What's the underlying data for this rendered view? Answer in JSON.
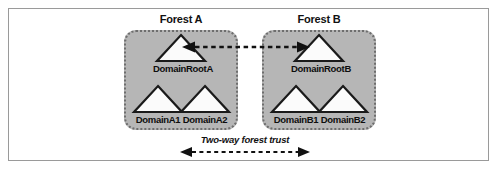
{
  "figure": {
    "name": "active-directory-two-way-forest-trust-diagram",
    "background_color": "#ffffff",
    "frame_border_color": "#9a9a9a"
  },
  "colors": {
    "forest_fill": "#b6b6b6",
    "forest_border": "#6e6e6e",
    "triangle_fill": "#fbfbfb",
    "triangle_stroke": "#1a1a1a",
    "arrow_color": "#111111",
    "text_color": "#111111"
  },
  "forests": [
    {
      "id": "forest-a",
      "title": "Forest A",
      "root": {
        "id": "domain-root-a",
        "label": "DomainRootA",
        "icon": "triangle-icon"
      },
      "children": [
        {
          "id": "domain-a1",
          "label": "DomainA1",
          "icon": "triangle-icon"
        },
        {
          "id": "domain-a2",
          "label": "DomainA2",
          "icon": "triangle-icon"
        }
      ]
    },
    {
      "id": "forest-b",
      "title": "Forest B",
      "root": {
        "id": "domain-root-b",
        "label": "DomainRootB",
        "icon": "triangle-icon"
      },
      "children": [
        {
          "id": "domain-b1",
          "label": "DomainB1",
          "icon": "triangle-icon"
        },
        {
          "id": "domain-b2",
          "label": "DomainB2",
          "icon": "triangle-icon"
        }
      ]
    }
  ],
  "trust": {
    "caption": "Two-way forest trust",
    "style": "dashed",
    "direction": "bidirectional",
    "top_connector_name": "root-to-root-trust-arrow",
    "bottom_connector_name": "forest-to-forest-trust-arrow"
  }
}
